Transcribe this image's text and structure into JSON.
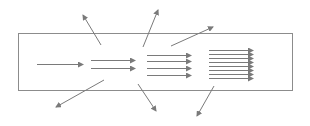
{
  "diagram": {
    "colors": {
      "stroke": "#8c8c8c",
      "arrow": "#7a7a7a",
      "background": "#ffffff"
    },
    "box": {
      "x": 18,
      "y": 33,
      "width": 274,
      "height": 57
    },
    "groups": [
      {
        "name": "group-1-line",
        "x1": 37,
        "x2": 83,
        "ys": [
          64
        ]
      },
      {
        "name": "group-2-lines",
        "x1": 91,
        "x2": 135,
        "ys": [
          60,
          68
        ]
      },
      {
        "name": "group-4-lines",
        "x1": 147,
        "x2": 191,
        "ys": [
          55,
          61,
          68,
          75
        ]
      },
      {
        "name": "group-8-lines",
        "x1": 209,
        "x2": 253,
        "ys": [
          50,
          54,
          58,
          62,
          66,
          70,
          74,
          78
        ]
      }
    ],
    "diagonals": [
      {
        "name": "arrow-up-left",
        "x1": 101,
        "y1": 45,
        "x2": 83,
        "y2": 15
      },
      {
        "name": "arrow-up-right",
        "x1": 143,
        "y1": 47,
        "x2": 158,
        "y2": 10
      },
      {
        "name": "arrow-right-up",
        "x1": 171,
        "y1": 46,
        "x2": 213,
        "y2": 27
      },
      {
        "name": "arrow-down-left",
        "x1": 104,
        "y1": 80,
        "x2": 56,
        "y2": 107
      },
      {
        "name": "arrow-down-right",
        "x1": 138,
        "y1": 84,
        "x2": 156,
        "y2": 111
      },
      {
        "name": "arrow-down-left-2",
        "x1": 214,
        "y1": 86,
        "x2": 197,
        "y2": 116
      }
    ]
  }
}
